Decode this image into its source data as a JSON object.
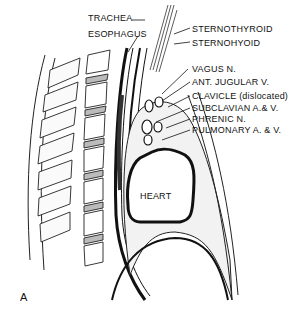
{
  "figure": {
    "panel_letter": "A",
    "center_label": "HEART",
    "labels_left": [
      "TRACHEA",
      "ESOPHAGUS"
    ],
    "labels_right": [
      "STERNOTHYROID",
      "STERNOHYOID",
      "VAGUS  N.",
      "ANT. JUGULAR  V.",
      "CLAVICLE (dislocated)",
      "SUBCLAVIAN  A.& V.",
      "PHRENIC  N.",
      "PULMONARY  A. & V."
    ]
  }
}
